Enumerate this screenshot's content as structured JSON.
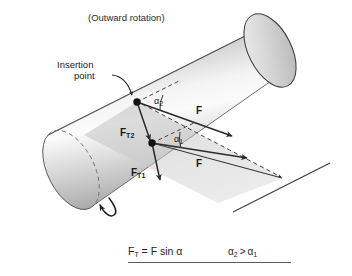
{
  "figure": {
    "title": "(Outward rotation)",
    "annotations": {
      "insertion_point_line1": "Insertion",
      "insertion_point_line2": "point",
      "alpha2": "α",
      "alpha2_sub": "2",
      "alpha1": "α",
      "alpha1_sub": "1",
      "force_upper": "F",
      "force_lower": "F",
      "tangential_upper": "F",
      "tangential_upper_sub": "T2",
      "tangential_lower": "F",
      "tangential_lower_sub": "T1"
    },
    "formula": {
      "lhs": "F",
      "lhs_sub": "T",
      "rhs": " = F sin α",
      "compare_left": "α",
      "compare_left_sub": "2",
      "compare_operator": ">",
      "compare_right": "α",
      "compare_right_sub": "1"
    },
    "colors": {
      "outline": "#3d3d3d",
      "cylinder_light": "#fdfdfd",
      "cylinder_mid": "#c9c9c9",
      "cylinder_dark": "#8f8f8f",
      "plane_fill": "#c4c4c4",
      "vector": "#2b2b2b",
      "text": "#1a1a1a",
      "background": "#ffffff"
    },
    "geometry": {
      "insertion_point_upper": [
        137,
        102
      ],
      "insertion_point_lower": [
        152,
        143
      ],
      "convergence_vertex": [
        283,
        178
      ]
    }
  }
}
